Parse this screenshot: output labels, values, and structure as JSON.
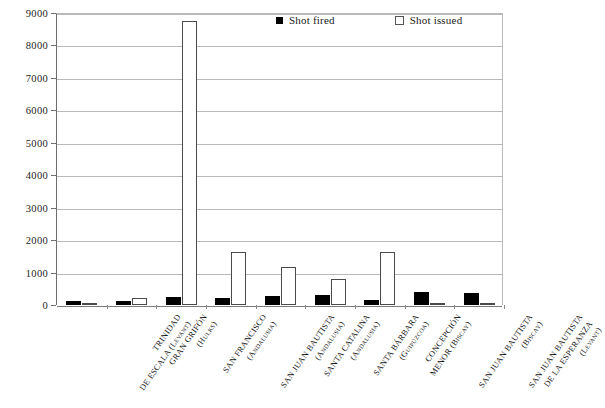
{
  "chart_data": {
    "type": "bar",
    "title": "",
    "xlabel": "",
    "ylabel": "",
    "ylim": [
      0,
      9000
    ],
    "yticks": [
      0,
      1000,
      2000,
      3000,
      4000,
      5000,
      6000,
      7000,
      8000,
      9000
    ],
    "ytick_labels": [
      "0",
      "1000",
      "2000",
      "3000",
      "4000",
      "5000",
      "6000",
      "7000",
      "8000",
      "9000"
    ],
    "grid": true,
    "legend_position": "top-right",
    "categories": [
      "TRINIDAD DE ESCALA (Levant)",
      "GRAN GRIFÓN (Hulks)",
      "SAN FRANCISCO (Andalusia)",
      "SAN JUAN BAUTISTA (Andalusia)",
      "SANTA CATALINA (Andalusia)",
      "SANTA BÁRBARA (Guipúzcoa)",
      "CONCEPCIÓN MENOR (Biscay)",
      "SAN JUAN BAUTISTA (Biscay)",
      "SAN JUAN BAUTISTA DE LA ESPERANZA (Levant)"
    ],
    "category_lines": [
      [
        "TRINIDAD",
        "DE ESCALA (Levant)"
      ],
      [
        "GRAN GRIFÓN",
        "(Hulks)"
      ],
      [
        "SAN FRANCISCO",
        "(Andalusia)"
      ],
      [
        "SAN JUAN BAUTISTA",
        "(Andalusia)"
      ],
      [
        "SANTA CATALINA",
        "(Andalusia)"
      ],
      [
        "SANTA BÁRBARA",
        "(Guipúzcoa)"
      ],
      [
        "CONCEPCIÓN",
        "MENOR (Biscay)"
      ],
      [
        "SAN JUAN BAUTISTA",
        "(Biscay)"
      ],
      [
        "SAN JUAN BAUTISTA",
        "DE LA ESPERANZA",
        "(Levant)"
      ]
    ],
    "series": [
      {
        "name": "Shot fired",
        "color": "#000000",
        "style": "filled",
        "values": [
          130,
          120,
          240,
          230,
          270,
          300,
          170,
          390,
          370
        ]
      },
      {
        "name": "Shot issued",
        "color": "#ffffff",
        "style": "outlined",
        "values": [
          30,
          220,
          8750,
          1620,
          1180,
          800,
          1640,
          0,
          0
        ]
      }
    ]
  },
  "legend": {
    "items": [
      {
        "label": "Shot fired",
        "style": "fired"
      },
      {
        "label": "Shot issued",
        "style": "issued"
      }
    ]
  }
}
